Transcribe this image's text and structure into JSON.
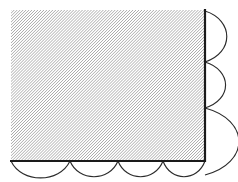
{
  "figure": {
    "canvas": {
      "width": 238,
      "height": 182,
      "background": "#ffffff"
    },
    "colors": {
      "hatch_line": "#7a7a7a",
      "hatch_background": "#ffffff",
      "thick_edge": "#1a1a1a",
      "arc_stroke": "#2b2b2b"
    },
    "hatch": {
      "pattern": "diagonal-lines-45deg",
      "angle_degrees": 45,
      "spacing_px": 2.1,
      "line_width_px": 0.9,
      "direction": "bottom-left-to-top-right"
    },
    "region": {
      "shape": "rectangle",
      "left": 11,
      "top": 10,
      "right": 205,
      "bottom": 161,
      "width": 194,
      "height": 151
    },
    "edges": [
      {
        "name": "left-edge",
        "type": "free",
        "stroke_width": 0
      },
      {
        "name": "top-edge",
        "type": "free",
        "stroke_width": 0
      },
      {
        "name": "right-edge",
        "type": "thick-boundary",
        "stroke_width": 2.2
      },
      {
        "name": "bottom-edge",
        "type": "thick-boundary",
        "stroke_width": 2.2
      }
    ],
    "scallops": {
      "right_side_count": 3,
      "bottom_side_count": 4,
      "right_arcs": [
        {
          "id": "right-arc-1",
          "y_start": 11,
          "y_end": 62,
          "bulge_px": 18
        },
        {
          "id": "right-arc-2",
          "y_start": 62,
          "y_end": 108,
          "bulge_px": 17
        },
        {
          "id": "right-arc-3",
          "y_start": 108,
          "y_end": 175,
          "bulge_px": 28
        }
      ],
      "bottom_arcs": [
        {
          "id": "bottom-arc-1",
          "x_start": 11,
          "x_end": 70,
          "bulge_px": 14
        },
        {
          "id": "bottom-arc-2",
          "x_start": 70,
          "x_end": 118,
          "bulge_px": 13
        },
        {
          "id": "bottom-arc-3",
          "x_start": 118,
          "x_end": 163,
          "bulge_px": 13
        },
        {
          "id": "bottom-arc-4",
          "x_start": 163,
          "x_end": 205,
          "bulge_px": 13
        }
      ]
    }
  }
}
